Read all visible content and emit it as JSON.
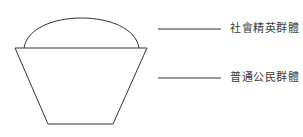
{
  "diagram": {
    "type": "structure-diagram",
    "stroke_color": "#333333",
    "shapes": {
      "dome": {
        "role": "social-elite-group"
      },
      "trapezoid": {
        "role": "ordinary-citizen-group"
      }
    },
    "labels": [
      {
        "id": "elite",
        "text": "社會精英群體"
      },
      {
        "id": "citizen",
        "text": "普通公民群體"
      }
    ]
  }
}
